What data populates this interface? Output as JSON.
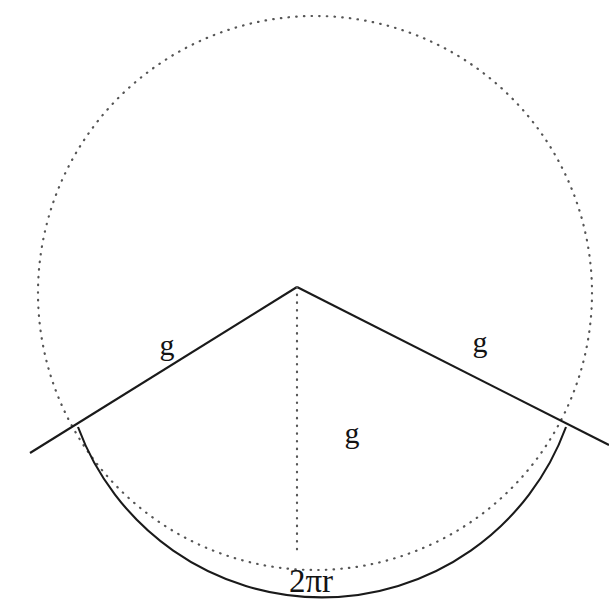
{
  "figure": {
    "background_color": "#ffffff",
    "stroke_color": "#1a1a1a",
    "dotted_color": "#555555",
    "canvas": {
      "width": 609,
      "height": 599
    }
  },
  "geometry": {
    "circle": {
      "name": "construction-circle",
      "center_x": 315,
      "center_y": 293,
      "radius": 277,
      "style": "dotted"
    },
    "apex": {
      "x": 297,
      "y": 287
    },
    "sector": {
      "left_arc_endpoint": {
        "x": 78,
        "y": 427
      },
      "right_arc_endpoint": {
        "x": 566,
        "y": 427
      },
      "arc_radius": 277,
      "arc_bottom": {
        "x": 310,
        "y": 554
      },
      "left_line_extension": {
        "x": 30,
        "y": 453
      },
      "right_line_extension": {
        "x": 609,
        "y": 445
      }
    },
    "axis_line": {
      "name": "apex-to-arc-dotted-axis",
      "from": {
        "x": 297,
        "y": 287
      },
      "to": {
        "x": 297,
        "y": 553
      },
      "style": "dotted"
    }
  },
  "labels": {
    "slant_left": {
      "text": "g",
      "x": 167,
      "y": 355
    },
    "slant_right": {
      "text": "g",
      "x": 480,
      "y": 352
    },
    "axis_center": {
      "text": "g",
      "x": 352,
      "y": 443
    },
    "base_arc": {
      "text": "2πr",
      "x": 311,
      "y": 592
    }
  }
}
